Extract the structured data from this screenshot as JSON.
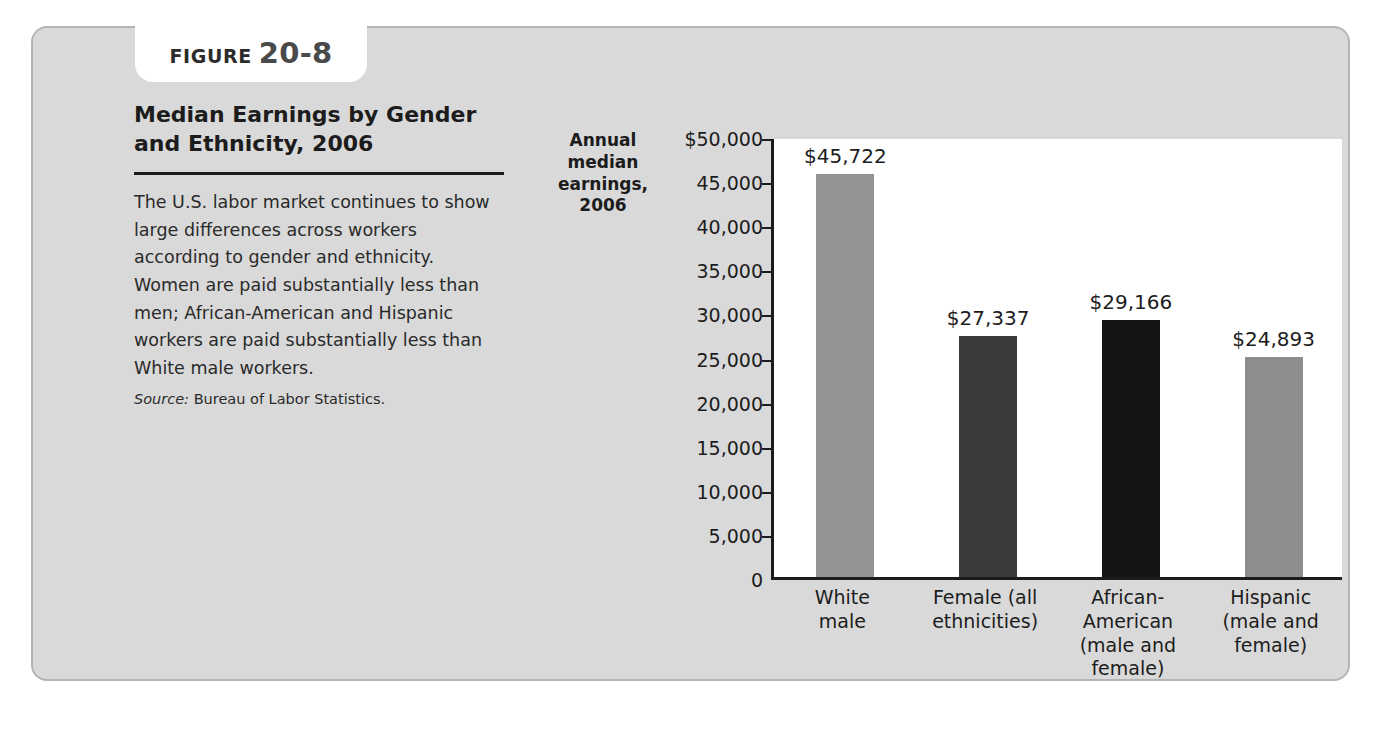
{
  "figure": {
    "label_word": "FIGURE",
    "label_number": "20-8",
    "title": "Median Earnings by Gender and Ethnicity, 2006",
    "body": "The U.S. labor market continues to show large differences across workers according to gender and ethnicity. Women are paid substantially less than men; African-American and Hispanic workers are paid substantially less than White male workers.",
    "source_label": "Source:",
    "source_text": "Bureau of Labor Statistics."
  },
  "chart_data": {
    "type": "bar",
    "title": "Median Earnings by Gender and Ethnicity, 2006",
    "xlabel": "",
    "ylabel": "Annual median earnings, 2006",
    "ylim": [
      0,
      50000
    ],
    "grid": false,
    "legend": "none",
    "categories": [
      "White male",
      "Female (all ethnicities)",
      "African-American (male and female)",
      "Hispanic (male and female)"
    ],
    "category_lines": [
      [
        "White",
        "male"
      ],
      [
        "Female (all",
        "ethnicities)"
      ],
      [
        "African-",
        "American",
        "(male and",
        "female)"
      ],
      [
        "Hispanic",
        "(male and",
        "female)"
      ]
    ],
    "values": [
      45722,
      27337,
      29166,
      24893
    ],
    "value_labels": [
      "$45,722",
      "$27,337",
      "$29,166",
      "$24,893"
    ],
    "bar_colors": [
      "#949494",
      "#3a3a3a",
      "#141414",
      "#8d8d8d"
    ],
    "ytick_values": [
      50000,
      45000,
      40000,
      35000,
      30000,
      25000,
      20000,
      15000,
      10000,
      5000,
      0
    ],
    "ytick_labels": [
      "$50,000",
      "45,000",
      "40,000",
      "35,000",
      "30,000",
      "25,000",
      "20,000",
      "15,000",
      "10,000",
      "5,000",
      "0"
    ]
  },
  "colors": {
    "card_background": "#d9d9d9",
    "card_border": "#b4b4b4",
    "plot_background": "#ffffff",
    "axis": "#1c1c1c",
    "text": "#1c1c1c"
  }
}
